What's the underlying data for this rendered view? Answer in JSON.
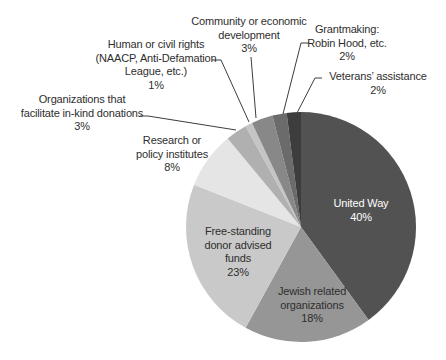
{
  "figure": {
    "background": "#ffffff",
    "text_color": "#2e2e2e",
    "line_color": "#3c3c3c"
  },
  "chart_data": {
    "type": "pie",
    "title": "",
    "unit": "%",
    "direction": "clockwise",
    "start_angle_deg": 0,
    "center": {
      "x": 301,
      "y": 227
    },
    "radius": 115,
    "slices": [
      {
        "label": "United Way",
        "value": 40,
        "color": "#525252"
      },
      {
        "label": "Jewish related organizations",
        "value": 18,
        "color": "#969696"
      },
      {
        "label": "Free-standing donor advised funds",
        "value": 23,
        "color": "#c9c9c9"
      },
      {
        "label": "Research or policy institutes",
        "value": 8,
        "color": "#e5e5e5"
      },
      {
        "label": "Organizations that facilitate in-kind donations",
        "value": 3,
        "color": "#b0b0b0"
      },
      {
        "label": "Human or civil rights (NAACP, Anti-Defamation League, etc.)",
        "value": 1,
        "color": "#c4c4c4"
      },
      {
        "label": "Community or economic development",
        "value": 3,
        "color": "#888888"
      },
      {
        "label": "Grantmaking: Robin Hood, etc.",
        "value": 2,
        "color": "#6b6b6b"
      },
      {
        "label": "Veterans’ assistance",
        "value": 2,
        "color": "#3d3d3d"
      }
    ],
    "callouts": [
      {
        "slice": "United Way",
        "lines": [
          "United Way",
          "40%"
        ],
        "x": 361,
        "y": 197,
        "inside": true,
        "color": "#ffffff"
      },
      {
        "slice": "Jewish related organizations",
        "lines": [
          "Jewish related",
          "organizations",
          "18%"
        ],
        "x": 312,
        "y": 285,
        "inside": true
      },
      {
        "slice": "Free-standing donor advised funds",
        "lines": [
          "Free-standing",
          "donor advised",
          "funds",
          "23%"
        ],
        "x": 238,
        "y": 225,
        "inside": true
      },
      {
        "slice": "Research or policy institutes",
        "lines": [
          "Research or",
          "policy institutes",
          "8%"
        ],
        "x": 172,
        "y": 134,
        "inside": false
      },
      {
        "slice": "Organizations that facilitate in-kind donations",
        "lines": [
          "Organizations that",
          "facilitate in-kind donations",
          "3%"
        ],
        "x": 82,
        "y": 93,
        "inside": false,
        "leader": [
          [
            140,
            116
          ],
          [
            148,
            116
          ],
          [
            236,
            130
          ]
        ]
      },
      {
        "slice": "Human or civil rights (NAACP, Anti-Defamation League, etc.)",
        "lines": [
          "Human or civil rights",
          "(NAACP, Anti-Defamation",
          "League, etc.)",
          "1%"
        ],
        "x": 156,
        "y": 38,
        "inside": false,
        "leader": [
          [
            212,
            60
          ],
          [
            221,
            60
          ],
          [
            249,
            122
          ]
        ]
      },
      {
        "slice": "Community or economic development",
        "lines": [
          "Community or economic",
          "development",
          "3%"
        ],
        "x": 249,
        "y": 15,
        "inside": false,
        "leader": [
          [
            251,
            57
          ],
          [
            256,
            118
          ]
        ]
      },
      {
        "slice": "Grantmaking: Robin Hood, etc.",
        "lines": [
          "Grantmaking:",
          "Robin Hood, etc.",
          "2%"
        ],
        "x": 347,
        "y": 23,
        "inside": false,
        "leader": [
          [
            309,
            43
          ],
          [
            301,
            43
          ],
          [
            283,
            114
          ]
        ]
      },
      {
        "slice": "Veterans’ assistance",
        "lines": [
          "Veterans’ assistance",
          "2%"
        ],
        "x": 378,
        "y": 70,
        "inside": false,
        "leader": [
          [
            322,
            78
          ],
          [
            315,
            78
          ],
          [
            297,
            113
          ]
        ]
      }
    ]
  }
}
